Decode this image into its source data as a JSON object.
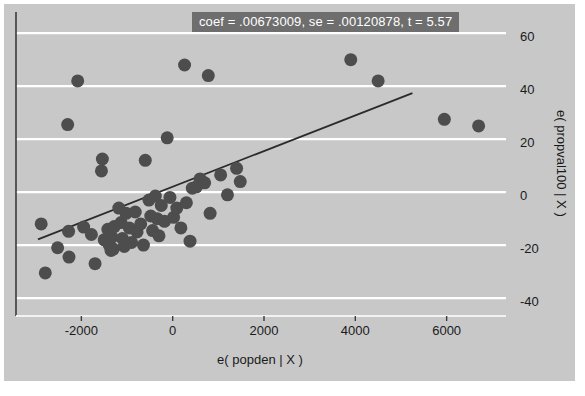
{
  "chart_data": {
    "type": "scatter",
    "title": "coef = .00673009, se = .00120878, t = 5.57",
    "xlabel": "e( popden | X )",
    "ylabel": "e( propval100 | X )",
    "xlim": [
      -3300,
      7300
    ],
    "ylim": [
      -46,
      68
    ],
    "xticks": [
      -2000,
      0,
      2000,
      4000,
      6000
    ],
    "xtick_labels": [
      "-2000",
      "0",
      "2000",
      "4000",
      "6000"
    ],
    "yticks": [
      60,
      40,
      20,
      0,
      -20,
      -40
    ],
    "ytick_labels": [
      "60",
      "40",
      "20",
      "0",
      "-20",
      "-40"
    ],
    "grid": "horizontal",
    "legend": "none",
    "marker_color": "#4d4d4d",
    "marker_size": 13,
    "line_color": "#2b2b2b",
    "background_color": "#c8c8c8",
    "gridline_color": "#ffffff",
    "fit_line": {
      "slope": 0.00673009,
      "se": 0.00120878,
      "t": 5.57,
      "x_start": -2950,
      "y_start": -17.8,
      "x_end": 5250,
      "y_end": 37.4
    },
    "points": [
      {
        "x": -2880,
        "y": -12.0
      },
      {
        "x": -2790,
        "y": -30.5
      },
      {
        "x": -2520,
        "y": -21.0
      },
      {
        "x": -2300,
        "y": 25.5
      },
      {
        "x": -2280,
        "y": -14.8
      },
      {
        "x": -2270,
        "y": -24.5
      },
      {
        "x": -2080,
        "y": 42.0
      },
      {
        "x": -1950,
        "y": -13.2
      },
      {
        "x": -1780,
        "y": -16.0
      },
      {
        "x": -1700,
        "y": -27.0
      },
      {
        "x": -1560,
        "y": 8.0
      },
      {
        "x": -1540,
        "y": 12.5
      },
      {
        "x": -1500,
        "y": -18.0
      },
      {
        "x": -1420,
        "y": -14.0
      },
      {
        "x": -1390,
        "y": -20.0
      },
      {
        "x": -1350,
        "y": -22.0
      },
      {
        "x": -1330,
        "y": -17.0
      },
      {
        "x": -1300,
        "y": -21.5
      },
      {
        "x": -1280,
        "y": -13.0
      },
      {
        "x": -1180,
        "y": -6.0
      },
      {
        "x": -1130,
        "y": -11.5
      },
      {
        "x": -1100,
        "y": -17.5
      },
      {
        "x": -1060,
        "y": -20.5
      },
      {
        "x": -1020,
        "y": -8.0
      },
      {
        "x": -950,
        "y": -13.5
      },
      {
        "x": -900,
        "y": -19.0
      },
      {
        "x": -820,
        "y": -7.5
      },
      {
        "x": -780,
        "y": -15.0
      },
      {
        "x": -700,
        "y": -12.0
      },
      {
        "x": -640,
        "y": -20.0
      },
      {
        "x": -600,
        "y": 12.0
      },
      {
        "x": -520,
        "y": -3.0
      },
      {
        "x": -480,
        "y": -9.0
      },
      {
        "x": -440,
        "y": -14.5
      },
      {
        "x": -380,
        "y": -1.5
      },
      {
        "x": -340,
        "y": -10.0
      },
      {
        "x": -300,
        "y": -16.5
      },
      {
        "x": -250,
        "y": -5.0
      },
      {
        "x": -180,
        "y": -11.0
      },
      {
        "x": -120,
        "y": 20.5
      },
      {
        "x": -60,
        "y": -2.0
      },
      {
        "x": 20,
        "y": -9.5
      },
      {
        "x": 90,
        "y": -6.0
      },
      {
        "x": 180,
        "y": -13.5
      },
      {
        "x": 260,
        "y": 48.0
      },
      {
        "x": 300,
        "y": -4.0
      },
      {
        "x": 380,
        "y": -18.5
      },
      {
        "x": 430,
        "y": 1.5
      },
      {
        "x": 520,
        "y": 2.0
      },
      {
        "x": 600,
        "y": 5.0
      },
      {
        "x": 700,
        "y": 3.5
      },
      {
        "x": 780,
        "y": 44.0
      },
      {
        "x": 820,
        "y": -8.0
      },
      {
        "x": 1050,
        "y": 6.5
      },
      {
        "x": 1200,
        "y": -1.0
      },
      {
        "x": 1400,
        "y": 9.0
      },
      {
        "x": 1480,
        "y": 4.0
      },
      {
        "x": 3900,
        "y": 50.0
      },
      {
        "x": 4500,
        "y": 42.0
      },
      {
        "x": 5950,
        "y": 27.5
      },
      {
        "x": 6700,
        "y": 25.0
      }
    ]
  }
}
